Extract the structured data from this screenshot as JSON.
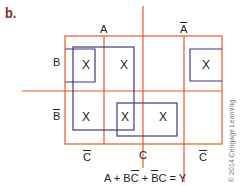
{
  "figure": {
    "label": "b.",
    "colors": {
      "map_lines": "#e8592b",
      "groupings": "#3b3d7a",
      "label_color": "#8b2a2a",
      "text": "#222222"
    }
  },
  "kmap": {
    "variable_labels": {
      "top": [
        {
          "text": "A",
          "negated": false
        },
        {
          "text": "A",
          "negated": true
        }
      ],
      "left": [
        {
          "text": "B",
          "negated": false
        },
        {
          "text": "B",
          "negated": true
        }
      ],
      "bottom": [
        {
          "text": "C",
          "negated": true
        },
        {
          "text": "C",
          "negated": false
        },
        {
          "text": "C",
          "negated": true
        }
      ]
    },
    "cells": [
      {
        "row": 0,
        "col": 0,
        "value": "X"
      },
      {
        "row": 0,
        "col": 1,
        "value": "X"
      },
      {
        "row": 0,
        "col": 2,
        "value": ""
      },
      {
        "row": 0,
        "col": 3,
        "value": "X"
      },
      {
        "row": 1,
        "col": 0,
        "value": "X"
      },
      {
        "row": 1,
        "col": 1,
        "value": "X"
      },
      {
        "row": 1,
        "col": 2,
        "value": "X"
      },
      {
        "row": 1,
        "col": 3,
        "value": ""
      }
    ],
    "groups": [
      {
        "name": "A",
        "description": "quad covering A columns"
      },
      {
        "name": "BC̄",
        "description": "pair wrapping B row C̄ cells"
      },
      {
        "name": "B̄C",
        "description": "pair in B̄ row C cells"
      }
    ]
  },
  "equation": {
    "parts": [
      {
        "text": "A",
        "over": ""
      },
      {
        "text": " + ",
        "over": ""
      },
      {
        "text": "B",
        "over": ""
      },
      {
        "text": "C",
        "over": "bar"
      },
      {
        "text": " + ",
        "over": ""
      },
      {
        "text": "B",
        "over": "bar"
      },
      {
        "text": "C",
        "over": ""
      },
      {
        "text": " = Y",
        "over": ""
      }
    ],
    "plain": "A + BC̄ + B̄C = Y"
  },
  "copyright": "© 2014 Cengage Learning"
}
